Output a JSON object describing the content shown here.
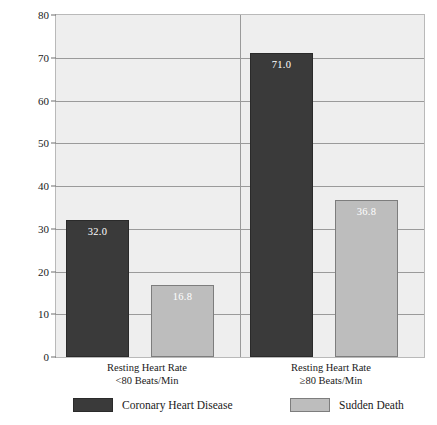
{
  "chart_data": {
    "type": "bar",
    "title": "",
    "xlabel": "",
    "ylabel": "10-Year Age-Adjusted Mortality (1958-68)/1,000 Men",
    "ylim": [
      0,
      80
    ],
    "ytick_values": [
      0,
      10,
      20,
      30,
      40,
      50,
      60,
      70,
      80
    ],
    "ytick_labels": [
      "0",
      "10",
      "20",
      "30",
      "40",
      "50",
      "60",
      "70",
      "80"
    ],
    "grid": "horizontal",
    "legend_position": "bottom",
    "categories": [
      {
        "line1": "Resting Heart Rate",
        "line2": "<80 Beats/Min"
      },
      {
        "line1": "Resting Heart Rate",
        "line2": "≥80 Beats/Min"
      }
    ],
    "series": [
      {
        "name": "Coronary Heart Disease",
        "color": "#3a3a3a",
        "values": [
          32.0,
          71.0
        ],
        "labels": [
          "32.0",
          "71.0"
        ]
      },
      {
        "name": "Sudden Death",
        "color": "#bdbdbd",
        "values": [
          16.8,
          36.8
        ],
        "labels": [
          "16.8",
          "36.8"
        ]
      }
    ]
  },
  "plot": {
    "background_color": "#eeeeee",
    "gridline_color": "#9a9a9a",
    "border_color": "#b9b9b9"
  }
}
